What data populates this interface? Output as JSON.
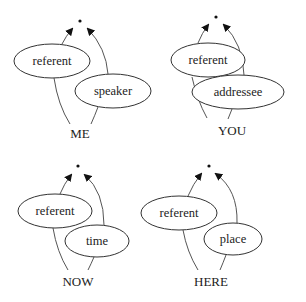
{
  "diagram": {
    "panels": [
      {
        "id": "me",
        "label": "ME",
        "nodes": [
          {
            "id": "referent",
            "label": "referent"
          },
          {
            "id": "speaker",
            "label": "speaker"
          }
        ],
        "edges": [
          {
            "from": "ME",
            "to": "root",
            "via": "referent"
          },
          {
            "from": "ME",
            "to": "root",
            "via": "speaker"
          }
        ]
      },
      {
        "id": "you",
        "label": "YOU",
        "nodes": [
          {
            "id": "referent",
            "label": "referent"
          },
          {
            "id": "addressee",
            "label": "addressee"
          }
        ],
        "edges": [
          {
            "from": "YOU",
            "to": "root",
            "via": "referent"
          },
          {
            "from": "YOU",
            "to": "root",
            "via": "addressee"
          }
        ]
      },
      {
        "id": "now",
        "label": "NOW",
        "nodes": [
          {
            "id": "referent",
            "label": "referent"
          },
          {
            "id": "time",
            "label": "time"
          }
        ],
        "edges": [
          {
            "from": "NOW",
            "to": "root",
            "via": "referent"
          },
          {
            "from": "NOW",
            "to": "root",
            "via": "time"
          }
        ]
      },
      {
        "id": "here",
        "label": "HERE",
        "nodes": [
          {
            "id": "referent",
            "label": "referent"
          },
          {
            "id": "place",
            "label": "place"
          }
        ],
        "edges": [
          {
            "from": "HERE",
            "to": "root",
            "via": "referent"
          },
          {
            "from": "HERE",
            "to": "root",
            "via": "place"
          }
        ]
      }
    ],
    "root_symbol": "•"
  }
}
